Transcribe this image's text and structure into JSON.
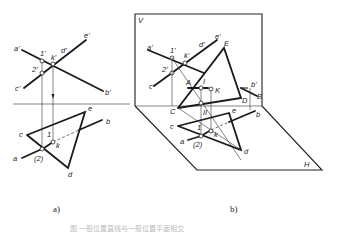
{
  "figure_a": {
    "caption": "a)",
    "labels": {
      "a_prime": "a'",
      "b_prime": "b'",
      "c_prime": "c'",
      "d_prime": "d'",
      "e_prime": "e'",
      "one_prime": "1'",
      "two_prime": "2'",
      "k_prime": "k'",
      "a": "a",
      "b": "b",
      "c": "c",
      "d": "d",
      "e": "e",
      "one": "1",
      "two": "(2)",
      "k": "k"
    }
  },
  "figure_b": {
    "caption": "b)",
    "labels": {
      "V": "V",
      "H": "H",
      "a_prime": "a'",
      "b_prime": "b'",
      "c_prime": "c'",
      "d_prime": "d'",
      "e_prime": "e'",
      "one_prime": "1'",
      "two_prime": "2'",
      "k_prime": "k'",
      "A": "A",
      "B": "B",
      "D": "D",
      "E": "E",
      "K": "K",
      "I": "I",
      "II": "II",
      "C": "C",
      "a": "a",
      "b": "b",
      "c": "c",
      "d": "d",
      "e": "e",
      "one": "1",
      "two": "(2)",
      "k": "k"
    }
  },
  "figure_caption": "图 一般位置直线与一般位置平面相交"
}
